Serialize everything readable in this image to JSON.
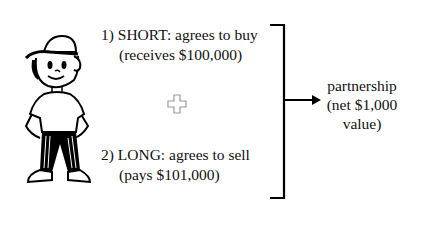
{
  "figure": {
    "icon": "cartoon-boy-icon"
  },
  "short_position": {
    "line1": "1) SHORT:  agrees to buy",
    "line2": "(receives $100,000)"
  },
  "plus_icon": "plus-icon",
  "long_position": {
    "line1": "2) LONG:  agrees to sell",
    "line2": "(pays $101,000)"
  },
  "result": {
    "line1": "partnership",
    "line2": "(net $1,000",
    "line3": "value)"
  }
}
